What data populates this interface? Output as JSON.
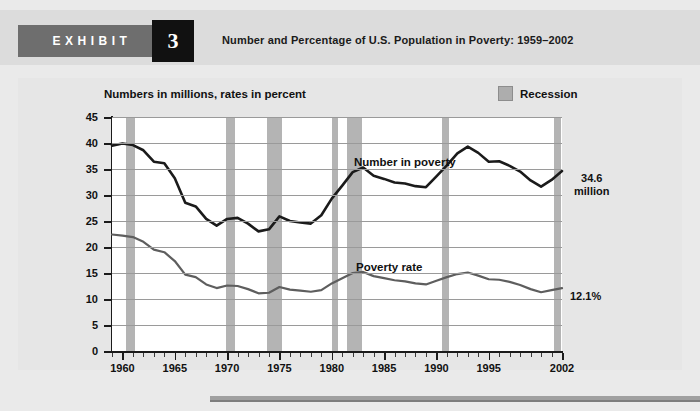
{
  "header": {
    "exhibit_word": "EXHIBIT",
    "exhibit_number": "3",
    "title": "Number and Percentage of U.S. Population in Poverty: 1959–2002"
  },
  "figure": {
    "subtitle": "Numbers in millions, rates in percent",
    "legend": {
      "label": "Recession",
      "swatch_color": "#b4b4b4"
    },
    "end_label_number": "34.6\nmillion",
    "end_label_number_line1": "34.6",
    "end_label_number_line2": "million",
    "end_label_rate": "12.1%"
  },
  "chart_data": {
    "type": "line",
    "title": "Number and Percentage of U.S. Population in Poverty: 1959–2002",
    "subtitle": "Numbers in millions, rates in percent",
    "xlabel": "",
    "ylabel": "",
    "xlim": [
      1959,
      2002
    ],
    "ylim": [
      0,
      45
    ],
    "ytick_labels": [
      "0",
      "5",
      "10",
      "15",
      "20",
      "25",
      "30",
      "35",
      "40",
      "45"
    ],
    "ytick_values": [
      0,
      5,
      10,
      15,
      20,
      25,
      30,
      35,
      40,
      45
    ],
    "xtick_labels": [
      "1960",
      "1965",
      "1970",
      "1975",
      "1980",
      "1985",
      "1990",
      "1995",
      "2002"
    ],
    "xtick_values": [
      1960,
      1965,
      1970,
      1975,
      1980,
      1985,
      1990,
      1995,
      2002
    ],
    "xtick_minor_step": 1,
    "grid": true,
    "legend_position": "top-right",
    "x": [
      1959,
      1960,
      1961,
      1962,
      1963,
      1964,
      1965,
      1966,
      1967,
      1968,
      1969,
      1970,
      1971,
      1972,
      1973,
      1974,
      1975,
      1976,
      1977,
      1978,
      1979,
      1980,
      1981,
      1982,
      1983,
      1984,
      1985,
      1986,
      1987,
      1988,
      1989,
      1990,
      1991,
      1992,
      1993,
      1994,
      1995,
      1996,
      1997,
      1998,
      1999,
      2000,
      2001,
      2002
    ],
    "series": [
      {
        "name": "Number in poverty",
        "unit": "millions",
        "color": "#1b1b1b",
        "values": [
          39.5,
          39.9,
          39.6,
          38.6,
          36.4,
          36.1,
          33.2,
          28.5,
          27.8,
          25.4,
          24.1,
          25.4,
          25.6,
          24.5,
          23.0,
          23.4,
          25.9,
          25.0,
          24.7,
          24.5,
          26.1,
          29.3,
          31.8,
          34.4,
          35.3,
          33.7,
          33.1,
          32.4,
          32.2,
          31.7,
          31.5,
          33.6,
          35.7,
          38.0,
          39.3,
          38.1,
          36.4,
          36.5,
          35.6,
          34.5,
          32.8,
          31.6,
          32.9,
          34.6
        ]
      },
      {
        "name": "Poverty rate",
        "unit": "percent",
        "color": "#5e5e5e",
        "values": [
          22.4,
          22.2,
          21.9,
          21.0,
          19.5,
          19.0,
          17.3,
          14.7,
          14.2,
          12.8,
          12.1,
          12.6,
          12.5,
          11.9,
          11.1,
          11.2,
          12.3,
          11.8,
          11.6,
          11.4,
          11.7,
          13.0,
          14.0,
          15.0,
          15.2,
          14.4,
          14.0,
          13.6,
          13.4,
          13.0,
          12.8,
          13.5,
          14.2,
          14.8,
          15.1,
          14.5,
          13.8,
          13.7,
          13.3,
          12.7,
          11.9,
          11.3,
          11.7,
          12.1
        ]
      }
    ],
    "annotations": [
      {
        "text": "Number in poverty",
        "x": 1982,
        "y": 38.5
      },
      {
        "text": "Poverty rate",
        "x": 1982,
        "y": 17.0
      },
      {
        "text": "34.6 million",
        "x": 2002,
        "y": 34.6,
        "position": "right-of-axis"
      },
      {
        "text": "12.1%",
        "x": 2002,
        "y": 12.1,
        "position": "right-of-axis"
      }
    ],
    "recession_bands": [
      {
        "start": 1960.3,
        "end": 1961.2
      },
      {
        "start": 1969.9,
        "end": 1970.8
      },
      {
        "start": 1973.8,
        "end": 1975.2
      },
      {
        "start": 1980.0,
        "end": 1980.6
      },
      {
        "start": 1981.5,
        "end": 1982.9
      },
      {
        "start": 1990.5,
        "end": 1991.2
      },
      {
        "start": 2001.2,
        "end": 2001.9
      }
    ]
  }
}
